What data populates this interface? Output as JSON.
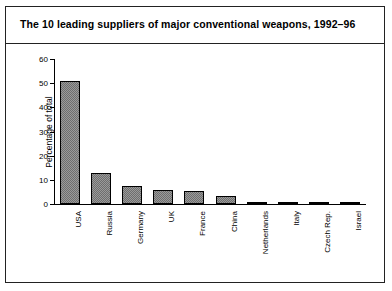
{
  "figure": {
    "title": "The 10 leading suppliers of major conventional weapons, 1992–96",
    "frame_color": "#222222",
    "bar_fill_color": "#9a9a9a",
    "bar_edge_color": "#000000"
  },
  "chart_data": {
    "type": "bar",
    "title": "The 10 leading suppliers of major conventional weapons, 1992–96",
    "xlabel": "",
    "ylabel": "Percentage of total",
    "ylim": [
      0,
      60
    ],
    "yticks": [
      0,
      10,
      20,
      30,
      40,
      50,
      60
    ],
    "grid": false,
    "legend": "none",
    "categories": [
      "USA",
      "Russia",
      "Germany",
      "UK",
      "France",
      "China",
      "Netherlands",
      "Italy",
      "Czech Rep.",
      "Israel"
    ],
    "values": [
      51,
      13,
      7.5,
      6,
      5.5,
      3.5,
      1,
      0.6,
      0.6,
      0.6
    ]
  }
}
